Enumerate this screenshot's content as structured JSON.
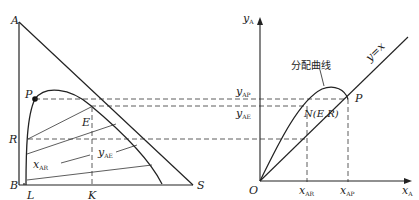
{
  "left_diagram": {
    "vertices": {
      "A": "A",
      "B": "B",
      "S": "S"
    },
    "points": {
      "P": "P",
      "R": "R",
      "E": "E",
      "L": "L",
      "K": "K"
    },
    "labels": {
      "x_main": "x",
      "x_sub": "AR",
      "y_main": "y",
      "y_sub": "AE"
    }
  },
  "right_diagram": {
    "y_axis": {
      "main": "y",
      "sub": "A"
    },
    "x_axis": {
      "main": "x",
      "sub": "A"
    },
    "origin": "O",
    "curve_label": "分配曲线",
    "diagonal_label": "y=x",
    "point_P": "P",
    "point_N": "N(E,R)",
    "y_ticks": [
      {
        "main": "y",
        "sub": "AP"
      },
      {
        "main": "y",
        "sub": "AE"
      }
    ],
    "x_ticks": [
      {
        "main": "x",
        "sub": "AR"
      },
      {
        "main": "x",
        "sub": "AP"
      }
    ]
  }
}
